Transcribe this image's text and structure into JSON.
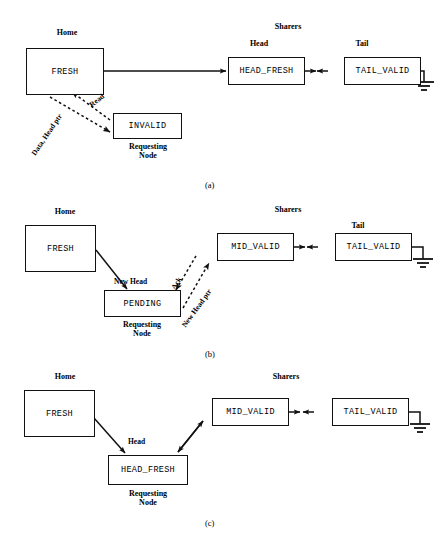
{
  "figure": {
    "panels": [
      {
        "id": "a",
        "label": "(a)",
        "group_labels": [
          {
            "name": "home-label",
            "text": "Home"
          },
          {
            "name": "sharers-label",
            "text": "Sharers"
          },
          {
            "name": "head-label",
            "text": "Head"
          },
          {
            "name": "tail-label",
            "text": "Tail"
          },
          {
            "name": "requesting-node-label",
            "text": "Requesting\nNode"
          }
        ],
        "boxes": [
          {
            "name": "home-node",
            "state": "FRESH"
          },
          {
            "name": "requesting-node",
            "state": "INVALID"
          },
          {
            "name": "head-sharer-node",
            "state": "HEAD_FRESH"
          },
          {
            "name": "tail-sharer-node",
            "state": "TAIL_VALID"
          }
        ],
        "edges": [
          {
            "name": "read-message",
            "text": "Read",
            "style": "dashed"
          },
          {
            "name": "data-head-ptr-message",
            "text": "Data, Head ptr",
            "style": "dashed"
          }
        ]
      },
      {
        "id": "b",
        "label": "(b)",
        "group_labels": [
          {
            "name": "home-label",
            "text": "Home"
          },
          {
            "name": "sharers-label",
            "text": "Sharers"
          },
          {
            "name": "tail-label",
            "text": "Tail"
          },
          {
            "name": "requesting-node-label",
            "text": "Requesting\nNode"
          }
        ],
        "boxes": [
          {
            "name": "home-node",
            "state": "FRESH"
          },
          {
            "name": "requesting-node",
            "state": "PENDING"
          },
          {
            "name": "mid-sharer-node",
            "state": "MID_VALID"
          },
          {
            "name": "tail-sharer-node",
            "state": "TAIL_VALID"
          }
        ],
        "edges": [
          {
            "name": "new-head-edge",
            "text": "New Head",
            "style": "solid"
          },
          {
            "name": "ack-message",
            "text": "Ack",
            "style": "dashed"
          },
          {
            "name": "new-head-ptr-message",
            "text": "New Head ptr",
            "style": "dashed"
          }
        ]
      },
      {
        "id": "c",
        "label": "(c)",
        "group_labels": [
          {
            "name": "home-label",
            "text": "Home"
          },
          {
            "name": "sharers-label",
            "text": "Sharers"
          },
          {
            "name": "head-label",
            "text": "Head"
          },
          {
            "name": "requesting-node-label",
            "text": "Requesting\nNode"
          }
        ],
        "boxes": [
          {
            "name": "home-node",
            "state": "FRESH"
          },
          {
            "name": "requesting-node",
            "state": "HEAD_FRESH"
          },
          {
            "name": "mid-sharer-node",
            "state": "MID_VALID"
          },
          {
            "name": "tail-sharer-node",
            "state": "TAIL_VALID"
          }
        ],
        "edges": []
      }
    ],
    "colors": {
      "stroke": "#111111",
      "background": "#ffffff",
      "text": "#000000"
    }
  }
}
